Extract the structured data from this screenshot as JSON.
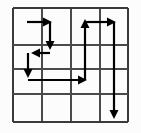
{
  "figure": {
    "width": 141,
    "height": 133,
    "background_color": "#fcfcfc"
  },
  "grid": {
    "rows": 4,
    "cols": 4,
    "left": 13,
    "top": 8,
    "right": 128,
    "bottom": 122,
    "x_lines": [
      13,
      42,
      71,
      100,
      128
    ],
    "y_lines": [
      8,
      45,
      69,
      94,
      122
    ],
    "border_color": "#3a3a3a",
    "inner_color": "#4a4a4a",
    "border_width": 2.4,
    "inner_width": 1.8
  },
  "arrows": {
    "color": "#000000",
    "stroke_width": 2.2,
    "head_length": 9,
    "head_width": 9,
    "segments": [
      {
        "name": "arrow-1-right-top-left",
        "direction": "right",
        "x1": 27,
        "y1": 22,
        "x2": 52,
        "y2": 22,
        "head": true
      },
      {
        "name": "arrow-2-down-col2",
        "direction": "down",
        "x1": 50,
        "y1": 22,
        "x2": 50,
        "y2": 50,
        "head": true
      },
      {
        "name": "arrow-3-left-row2",
        "direction": "left",
        "x1": 50,
        "y1": 53,
        "x2": 31,
        "y2": 53,
        "head": true
      },
      {
        "name": "arrow-4-down-col1",
        "direction": "down",
        "x1": 28,
        "y1": 53,
        "x2": 28,
        "y2": 78,
        "head": true
      },
      {
        "name": "arrow-5-right-row3",
        "direction": "right",
        "x1": 28,
        "y1": 80,
        "x2": 87,
        "y2": 80,
        "head": true
      },
      {
        "name": "arrow-6-up-col3",
        "direction": "up",
        "x1": 85,
        "y1": 80,
        "x2": 85,
        "y2": 19,
        "head": true
      },
      {
        "name": "arrow-7-right-row1",
        "direction": "right",
        "x1": 85,
        "y1": 22,
        "x2": 116,
        "y2": 22,
        "head": true
      },
      {
        "name": "arrow-8-down-col4",
        "direction": "down",
        "x1": 114,
        "y1": 22,
        "x2": 114,
        "y2": 119,
        "head": true
      }
    ]
  }
}
